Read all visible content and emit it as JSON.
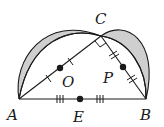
{
  "diagram": {
    "points": {
      "A": {
        "label": "A",
        "x": 19,
        "y": 99
      },
      "B": {
        "label": "B",
        "x": 146,
        "y": 99
      },
      "C": {
        "label": "C",
        "x": 101,
        "y": 36
      },
      "O": {
        "label": "O",
        "x": 60,
        "y": 68
      },
      "P": {
        "label": "P",
        "x": 123,
        "y": 67
      },
      "E": {
        "label": "E",
        "x": 82,
        "y": 99
      }
    },
    "labels": {
      "A": "A",
      "B": "B",
      "C": "C",
      "O": "O",
      "P": "P",
      "E": "E"
    },
    "annotations": {
      "right_angle_at": "C",
      "AO_OC_tick": "single",
      "CP_PB_tick": "double",
      "AE_EB_tick": "triple"
    },
    "colors": {
      "stroke": "#1a1a1a",
      "shade": "#cfcfcf",
      "background": "#ffffff"
    }
  }
}
